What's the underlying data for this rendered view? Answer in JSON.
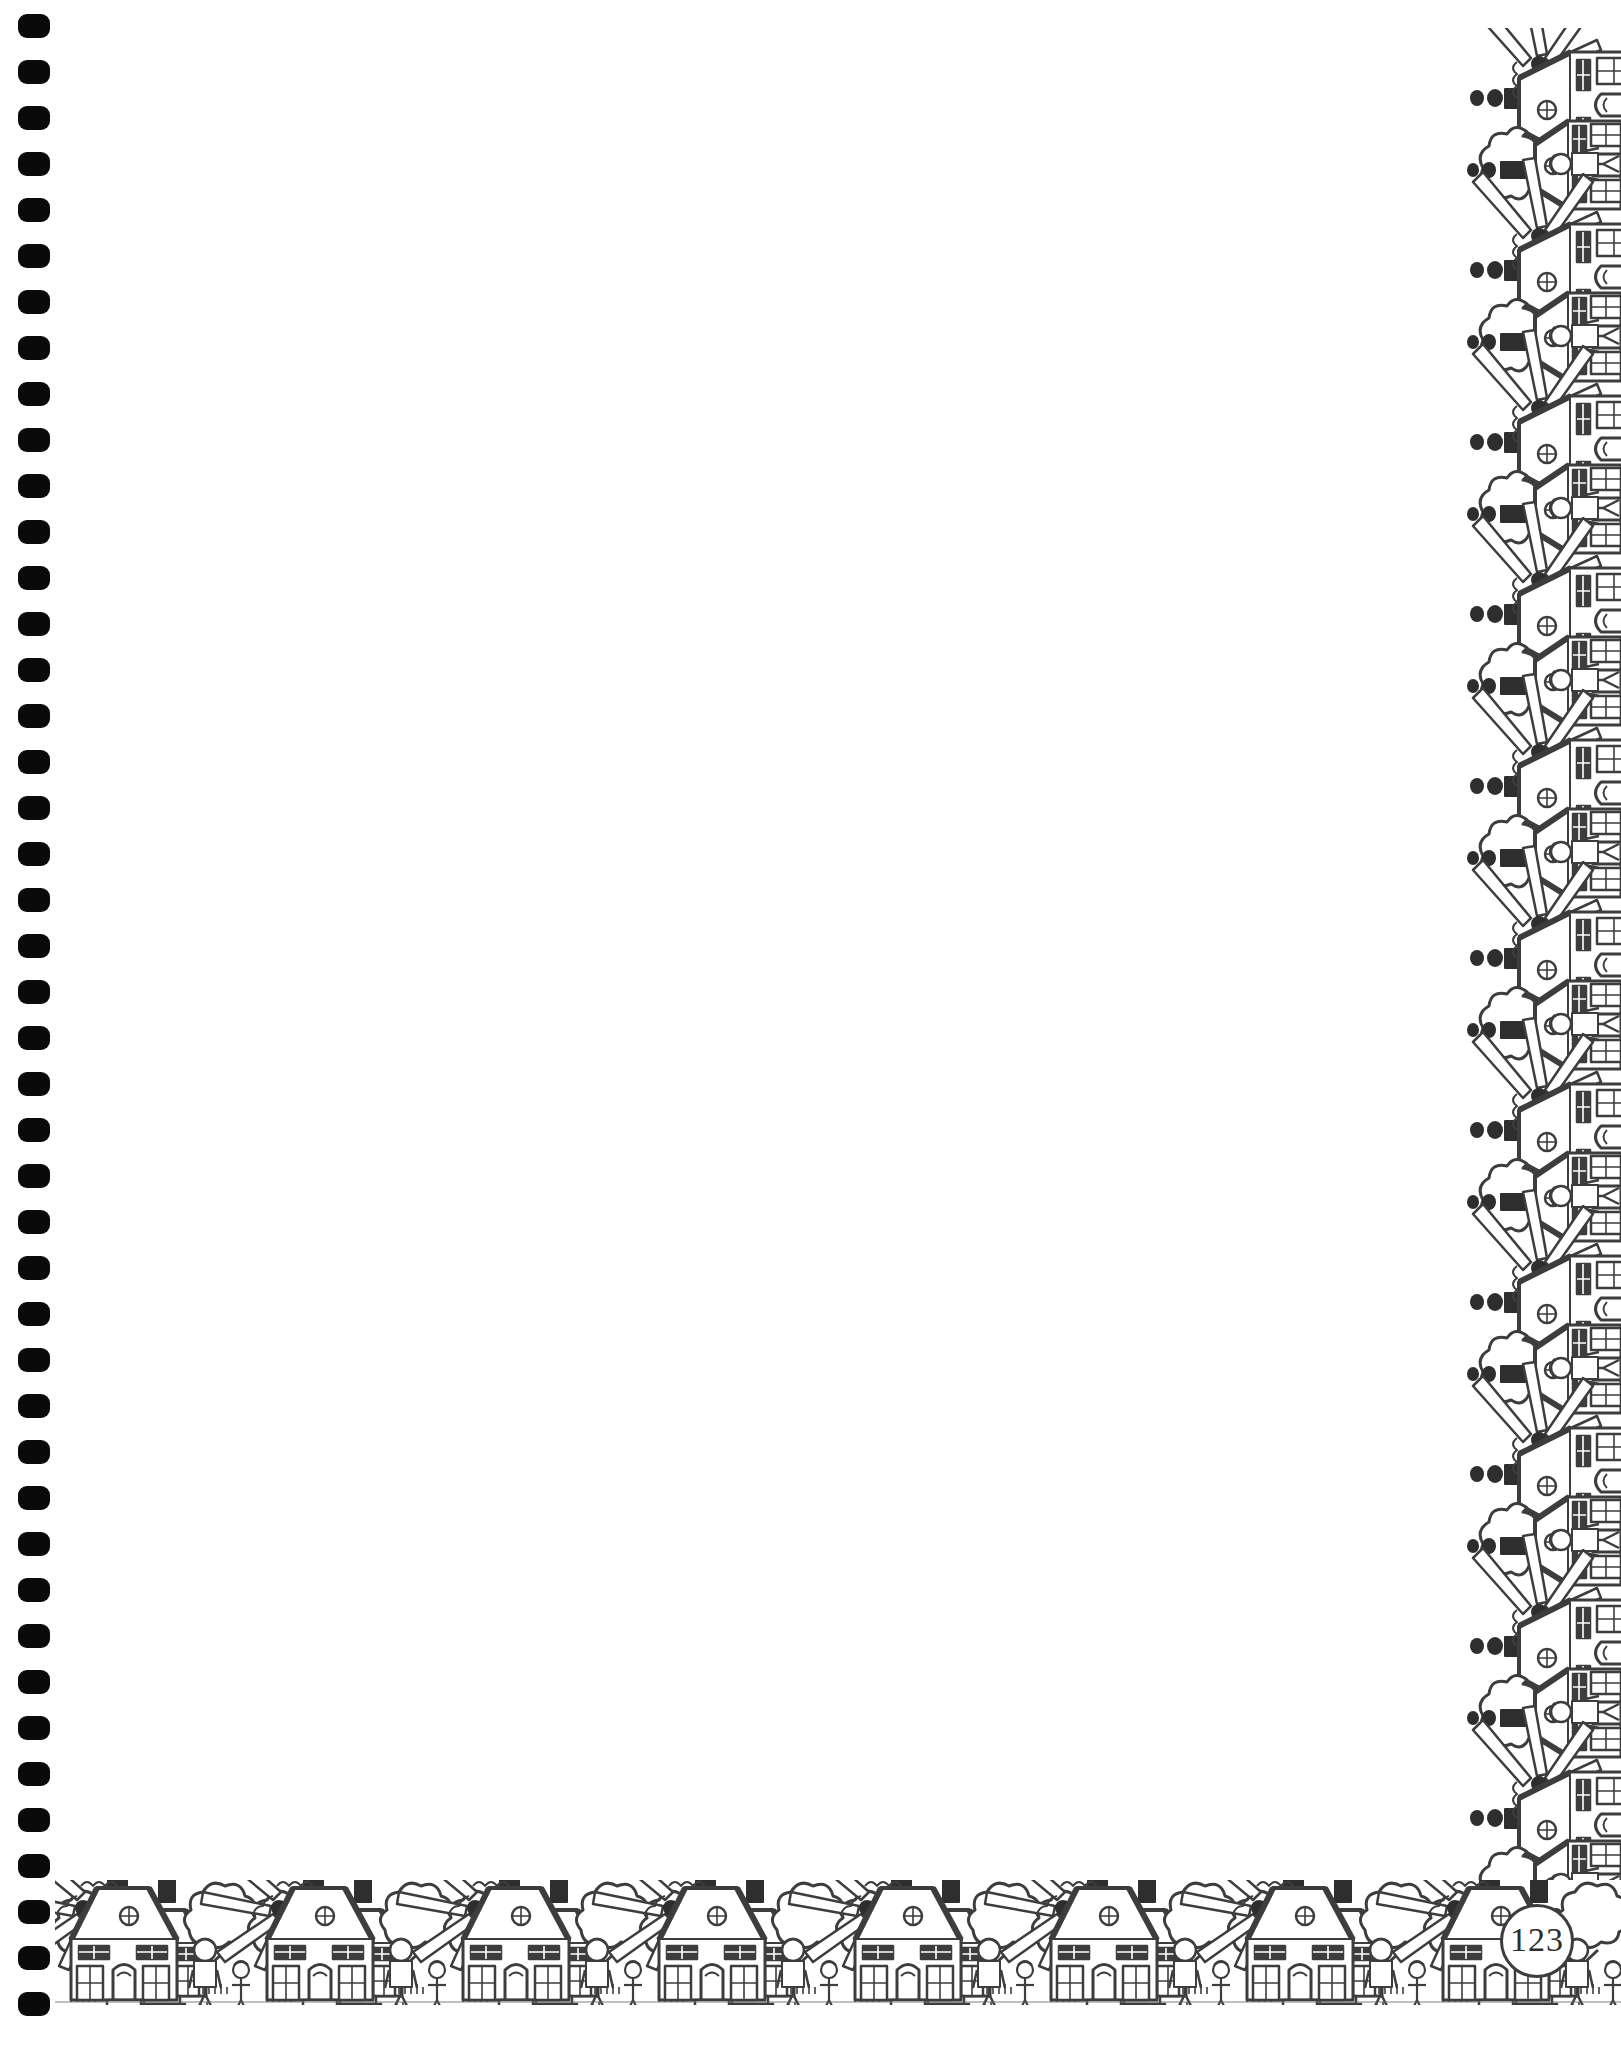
{
  "page": {
    "kind": "spiral-bound-notebook-page",
    "width": 1621,
    "height": 2047,
    "paper_color": "#ffffff",
    "ink_color": "#3d3d3d",
    "page_number": "123"
  },
  "binding": {
    "label": "spiral binding holes",
    "hole_count": 44,
    "hole_color": "#0a0a0a",
    "first_hole_top": 14,
    "hole_spacing": 46,
    "hole_width": 32,
    "hole_height": 24
  },
  "writing_area": {
    "label": "blank writing area",
    "content": ""
  },
  "borders": {
    "bottom": {
      "label": "village houses bottom border",
      "motif": "houses-trees-windmills",
      "repeat_count": 8,
      "unit_width": 196
    },
    "right": {
      "label": "village houses right border",
      "motif": "houses-trees-windmills-rotated",
      "repeat_count": 11,
      "unit_height": 172
    }
  },
  "icons": {
    "punch_hole": "punch-hole-icon",
    "house": "house-icon",
    "windmill": "windmill-icon",
    "tree": "tree-icon",
    "person": "person-icon",
    "chimney": "chimney-icon",
    "page_badge": "page-number-badge-icon"
  }
}
